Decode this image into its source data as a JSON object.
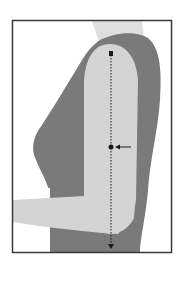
{
  "figure": {
    "description": "Mid-upper arm measurement illustration",
    "colors": {
      "background": "#ffffff",
      "frame": "#3a3a3a",
      "body": "#7a7a7a",
      "arm": "#d4d4d4",
      "neck": "#dedede",
      "marker": "#1a1a1a"
    },
    "annotations": {
      "measure_line": "shoulder-to-elbow dotted line",
      "midpoint": "midpoint marker",
      "pointer": "arrow pointing to midpoint"
    }
  }
}
